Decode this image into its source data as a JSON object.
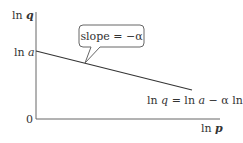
{
  "diagram": {
    "type": "log-log demand line",
    "y_axis": {
      "label_prefix": "ln ",
      "label_var": "q"
    },
    "x_axis": {
      "label_prefix": "ln ",
      "label_var": "p"
    },
    "origin_label": "0",
    "intercept": {
      "label_prefix": "ln ",
      "label_var": "a"
    },
    "callout": {
      "text": "slope = −α"
    },
    "equation": {
      "part1": "ln ",
      "q": "q",
      "part2": " = ln ",
      "a": "a",
      "part3": " − α ln ",
      "p": "p"
    },
    "colors": {
      "axis": "#666666",
      "line": "#333333",
      "text": "#333333",
      "callout_border": "#666666",
      "callout_fill": "#ffffff"
    }
  }
}
